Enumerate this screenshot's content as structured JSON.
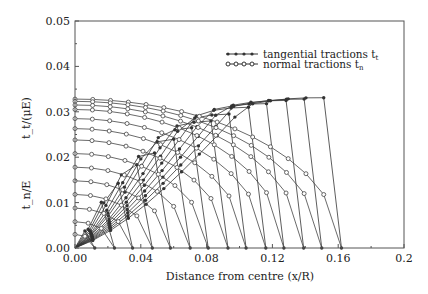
{
  "chart_data": {
    "type": "line",
    "title": "",
    "xlabel": "Distance from centre (x/R)",
    "ylabel_top": "t_t/(μE)",
    "ylabel_bottom": "t_n/E",
    "xlim": [
      0,
      0.2
    ],
    "ylim": [
      0,
      0.05
    ],
    "x_ticks": [
      "0.00",
      "0.04",
      "0.08",
      "0.12",
      "0.16",
      "0.2"
    ],
    "x_tick_values": [
      0,
      0.04,
      0.08,
      0.12,
      0.16,
      0.2
    ],
    "y_ticks": [
      "0.00",
      "0.01",
      "0.02",
      "0.03",
      "0.04",
      "0.05"
    ],
    "y_tick_values": [
      0,
      0.01,
      0.02,
      0.03,
      0.04,
      0.05
    ],
    "grid": false,
    "legend": {
      "position": "upper right",
      "entries": [
        {
          "label": "tangential tractions  t",
          "sub": "t",
          "marker": "filled-dot"
        },
        {
          "label": "normal tractions   t",
          "sub": "n",
          "marker": "open-circle"
        }
      ]
    },
    "tangential_curve_ends": [
      0.012,
      0.024,
      0.035,
      0.047,
      0.058,
      0.07,
      0.081,
      0.093,
      0.104,
      0.116,
      0.127,
      0.139,
      0.15,
      0.162
    ],
    "tangential_peak_values": [
      0.0055,
      0.0105,
      0.0145,
      0.0185,
      0.021,
      0.024,
      0.0265,
      0.028,
      0.0295,
      0.031,
      0.0318,
      0.0325,
      0.0328,
      0.0331
    ],
    "normal_start_values": [
      0.0328,
      0.0323,
      0.0315,
      0.0305,
      0.0285,
      0.0263,
      0.0238,
      0.0208,
      0.0178,
      0.0148,
      0.0118,
      0.0088,
      0.0058,
      0.003
    ]
  }
}
